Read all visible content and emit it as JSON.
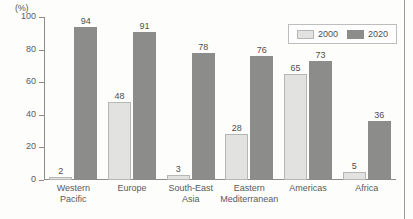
{
  "chart_data": {
    "type": "bar",
    "title": "",
    "subtitle": "",
    "unit_label": "(%)",
    "xlabel": "",
    "ylabel": "",
    "ylim": [
      0,
      100
    ],
    "yticks": [
      0,
      20,
      40,
      60,
      80,
      100
    ],
    "ytick_labels": [
      "0",
      "20",
      "40",
      "60",
      "80",
      "100"
    ],
    "grid": false,
    "legend_position": "top-right",
    "categories": [
      "Western\nPacific",
      "Europe",
      "South-East\nAsia",
      "Eastern\nMediterranean",
      "Americas",
      "Africa"
    ],
    "category_lines": [
      [
        "Western",
        "Pacific"
      ],
      [
        "Europe",
        ""
      ],
      [
        "South-East",
        "Asia"
      ],
      [
        "Eastern",
        "Mediterranean"
      ],
      [
        "Americas",
        ""
      ],
      [
        "Africa",
        ""
      ]
    ],
    "series": [
      {
        "name": "2000",
        "color": "#e2e2e0",
        "values": [
          2,
          48,
          3,
          28,
          65,
          5
        ]
      },
      {
        "name": "2020",
        "color": "#8c8c8a",
        "values": [
          94,
          91,
          78,
          76,
          73,
          36
        ]
      }
    ]
  },
  "legend": {
    "items": [
      {
        "label": "2000"
      },
      {
        "label": "2020"
      }
    ]
  },
  "colors": {
    "series_2000": "#e2e2e0",
    "series_2020": "#8c8c8a",
    "axis": "#8d8d8d",
    "text": "#5a5a5a",
    "background": "#fdfdfc"
  }
}
